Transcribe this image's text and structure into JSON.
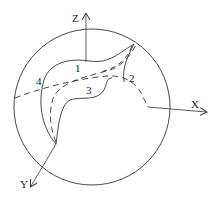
{
  "diagram": {
    "type": "3d-coordinate-sketch",
    "axes": {
      "x_label": "X",
      "y_label": "Y",
      "z_label": "Z"
    },
    "region_labels": {
      "r1": "1",
      "r2": "2",
      "r3": "3",
      "r4": "4"
    },
    "colors": {
      "stroke": "#333333",
      "background": "#ffffff"
    }
  }
}
